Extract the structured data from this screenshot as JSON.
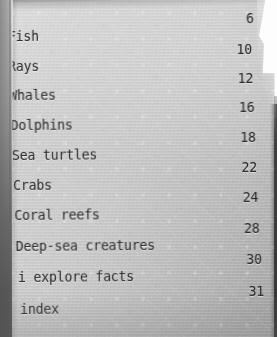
{
  "document": {
    "type": "book-table-of-contents",
    "paper_color": "#c6c6c6",
    "ink_color": "#232323",
    "entries": [
      {
        "label": "Fish",
        "page": "6"
      },
      {
        "label": "Rays",
        "page": "10"
      },
      {
        "label": "Whales",
        "page": "12"
      },
      {
        "label": "Dolphins",
        "page": "16"
      },
      {
        "label": "Sea turtles",
        "page": "18"
      },
      {
        "label": "Crabs",
        "page": "22"
      },
      {
        "label": "Coral reefs",
        "page": "24"
      },
      {
        "label": "Deep-sea creatures",
        "page": "28"
      },
      {
        "label": "i explore facts",
        "page": "30"
      },
      {
        "label": "index",
        "page": "31"
      }
    ]
  }
}
